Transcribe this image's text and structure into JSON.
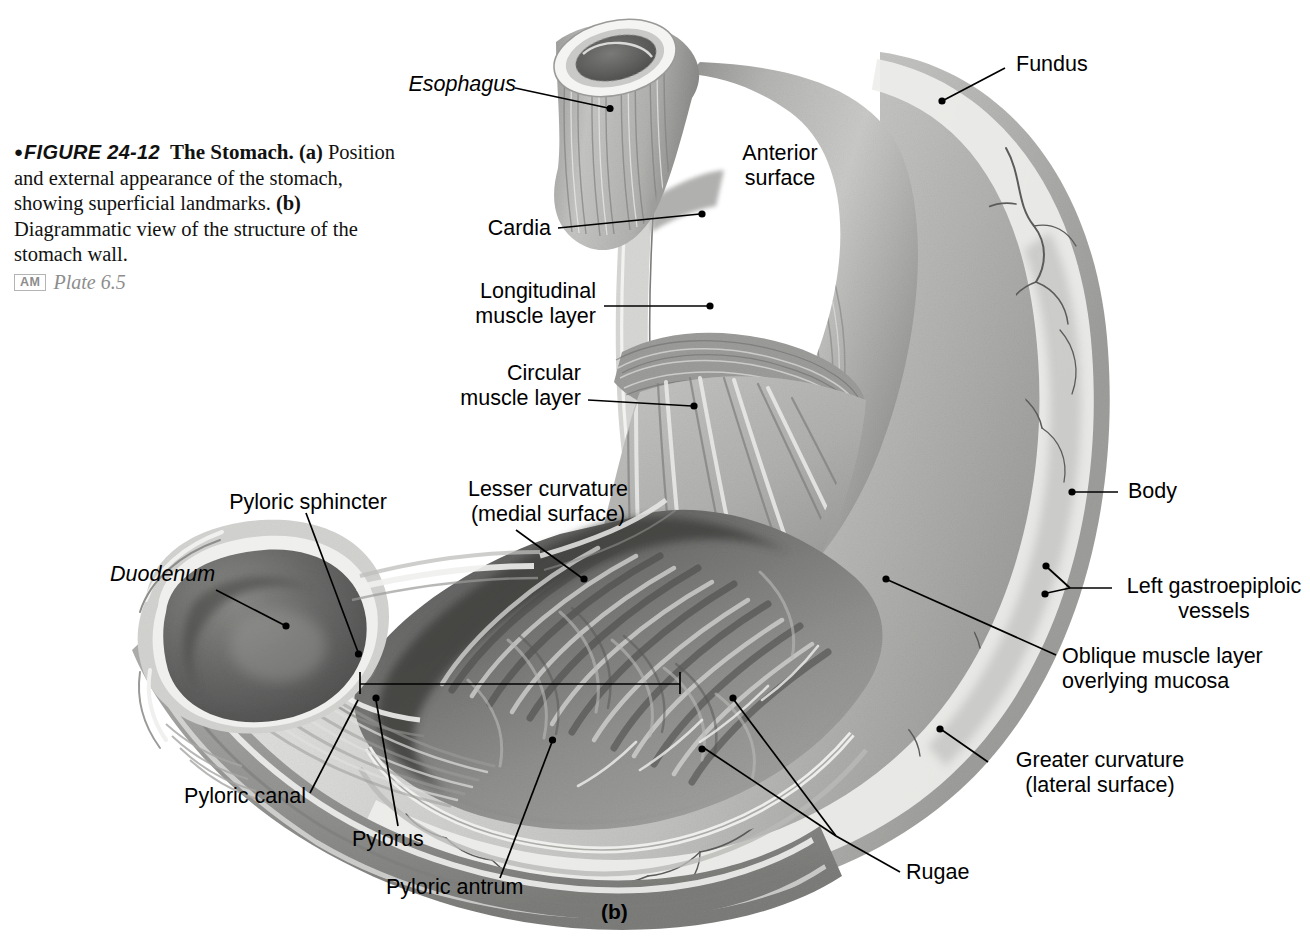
{
  "figure": {
    "bullet": "●",
    "number": "FIGURE 24-12",
    "title": "The Stomach.",
    "body_a_tag": "(a)",
    "body_a": " Position and external appearance of the stomach, showing superficial landmarks. ",
    "body_b_tag": "(b)",
    "body_b": " Diagrammatic view of the structure of the stomach wall.",
    "am_badge": "AM",
    "plate": "Plate 6.5",
    "panel_id": "(b)"
  },
  "labels": {
    "esophagus": "Esophagus",
    "fundus": "Fundus",
    "anterior_surface_l1": "Anterior",
    "anterior_surface_l2": "surface",
    "cardia": "Cardia",
    "longitudinal_l1": "Longitudinal",
    "longitudinal_l2": "muscle layer",
    "circular_l1": "Circular",
    "circular_l2": "muscle layer",
    "lesser_curvature_l1": "Lesser curvature",
    "lesser_curvature_l2": "(medial surface)",
    "pyloric_sphincter": "Pyloric sphincter",
    "duodenum": "Duodenum",
    "pyloric_canal": "Pyloric canal",
    "pylorus": "Pylorus",
    "pyloric_antrum": "Pyloric antrum",
    "rugae": "Rugae",
    "body": "Body",
    "left_gastroepiploic_l1": "Left gastroepiploic",
    "left_gastroepiploic_l2": "vessels",
    "oblique_l1": "Oblique muscle layer",
    "oblique_l2": "overlying mucosa",
    "greater_curvature_l1": "Greater curvature",
    "greater_curvature_l2": "(lateral surface)"
  },
  "colors": {
    "ink": "#000000",
    "page": "#ffffff",
    "serosa_light": "#d8d8d6",
    "serosa_mid": "#b9b9b7",
    "muscle_mid": "#a8a8a6",
    "muscle_dark": "#6f6f6e",
    "lumen_dark": "#4e4e4e",
    "rugae_mid": "#8d8d8b",
    "highlight": "#f4f4f2",
    "vessel": "#555553",
    "caption_gray": "#8d8d8d"
  },
  "figure_content": {
    "type": "anatomical-diagram",
    "subject": "Human stomach, diagrammatic cutaway (panel b)",
    "view": "Anterior view with anterior wall removed to reveal mucosa and rugae",
    "structures": [
      "Esophagus",
      "Cardia",
      "Fundus",
      "Body",
      "Longitudinal muscle layer",
      "Circular muscle layer",
      "Oblique muscle layer overlying mucosa",
      "Lesser curvature (medial surface)",
      "Greater curvature (lateral surface)",
      "Rugae",
      "Pyloric antrum",
      "Pyloric canal",
      "Pyloric sphincter",
      "Pylorus",
      "Duodenum",
      "Left gastroepiploic vessels",
      "Anterior surface"
    ]
  }
}
